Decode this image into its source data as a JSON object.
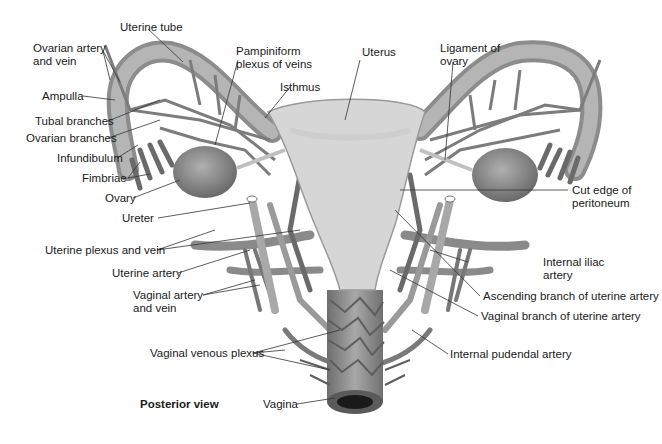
{
  "figure": {
    "view": "Posterior view",
    "labels_left": {
      "uterine_tube": "Uterine tube",
      "ovarian_artery_vein_1": "Ovarian artery",
      "ovarian_artery_vein_2": "and vein",
      "ampulla": "Ampulla",
      "tubal_branches": "Tubal branches",
      "ovarian_branches": "Ovarian branches",
      "infundibulum": "Infundibulum",
      "fimbriae": "Fimbriae",
      "ovary": "Ovary",
      "ureter": "Ureter",
      "uterine_plexus_vein": "Uterine plexus and vein",
      "uterine_artery": "Uterine artery",
      "vaginal_artery_vein_1": "Vaginal artery",
      "vaginal_artery_vein_2": "and vein",
      "vaginal_venous_plexus": "Vaginal venous plexus",
      "vagina": "Vagina"
    },
    "labels_top": {
      "pampiniform_1": "Pampiniform",
      "pampiniform_2": "plexus of veins",
      "isthmus": "Isthmus",
      "uterus": "Uterus",
      "ligament_ovary_1": "Ligament of",
      "ligament_ovary_2": "ovary"
    },
    "labels_right": {
      "cut_edge_1": "Cut edge of",
      "cut_edge_2": "peritoneum",
      "internal_iliac_1": "Internal iliac",
      "internal_iliac_2": "artery",
      "ascending_branch": "Ascending branch of uterine artery",
      "vaginal_branch": "Vaginal branch of uterine artery",
      "internal_pudendal": "Internal pudendal artery"
    },
    "colors": {
      "tissue": "#b8b8b8",
      "vessel": "#7a7a7a",
      "uterus": "#d4d4d4",
      "leader_line": "#333333"
    }
  }
}
